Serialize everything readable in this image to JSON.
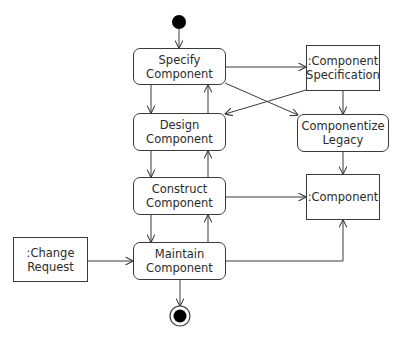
{
  "diagram": {
    "type": "UML activity diagram",
    "colors": {
      "stroke": "#3a3a3a",
      "text": "#2b2b2b",
      "fill": "#ffffff",
      "node_fill": "#000000"
    },
    "start_node": {
      "x": 179,
      "y": 22,
      "r": 7
    },
    "end_node": {
      "x": 180,
      "y": 316,
      "r": 10,
      "inner_r": 6
    },
    "activities": [
      {
        "id": "specify",
        "line1": "Specify",
        "line2": "Component",
        "x": 133,
        "y": 48,
        "w": 93,
        "h": 37
      },
      {
        "id": "design",
        "line1": "Design",
        "line2": "Component",
        "x": 133,
        "y": 113,
        "w": 93,
        "h": 38
      },
      {
        "id": "construct",
        "line1": "Construct",
        "line2": "Component",
        "x": 133,
        "y": 177,
        "w": 93,
        "h": 38
      },
      {
        "id": "maintain",
        "line1": "Maintain",
        "line2": "Component",
        "x": 133,
        "y": 242,
        "w": 93,
        "h": 38
      },
      {
        "id": "componentize",
        "line1": "Componentize",
        "line2": "Legacy",
        "x": 297,
        "y": 114,
        "w": 92,
        "h": 38
      }
    ],
    "objects": [
      {
        "id": "spec",
        "line1": ":Component",
        "line2": "Specification",
        "x": 306,
        "y": 45,
        "w": 74,
        "h": 46
      },
      {
        "id": "component",
        "line1": ":Component",
        "line2": "",
        "x": 306,
        "y": 174,
        "w": 74,
        "h": 46
      },
      {
        "id": "change",
        "line1": ":Change",
        "line2": "Request",
        "x": 13,
        "y": 237,
        "w": 75,
        "h": 45
      }
    ],
    "edges": [
      {
        "from": "start",
        "to": "specify"
      },
      {
        "from": "specify",
        "to": "design"
      },
      {
        "from": "design",
        "to": "specify"
      },
      {
        "from": "design",
        "to": "construct"
      },
      {
        "from": "construct",
        "to": "design"
      },
      {
        "from": "construct",
        "to": "maintain"
      },
      {
        "from": "maintain",
        "to": "construct"
      },
      {
        "from": "specify",
        "to": "spec"
      },
      {
        "from": "specify",
        "to": "componentize"
      },
      {
        "from": "spec",
        "to": "design"
      },
      {
        "from": "spec",
        "to": "componentize"
      },
      {
        "from": "componentize",
        "to": "component"
      },
      {
        "from": "construct",
        "to": "component"
      },
      {
        "from": "maintain",
        "to": "component"
      },
      {
        "from": "change",
        "to": "maintain"
      },
      {
        "from": "maintain",
        "to": "end"
      }
    ]
  }
}
